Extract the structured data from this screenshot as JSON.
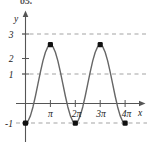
{
  "figure": {
    "problem_number": "65.",
    "axis_color": "#555555",
    "curve_color": "#666666",
    "grid_color": "#999999",
    "marker_color": "#111111",
    "background": "#ffffff"
  },
  "chart_data": {
    "type": "line",
    "title": "",
    "xlabel": "x",
    "ylabel": "y",
    "xlim": [
      -0.35,
      14.6
    ],
    "ylim": [
      -2.1,
      3.9
    ],
    "grid": true,
    "grid_lines_y": [
      3,
      1,
      -1
    ],
    "legend": null,
    "x_tick_labels": [
      "π",
      "2π",
      "3π",
      "4π"
    ],
    "x_tick_values": [
      3.14159,
      6.28319,
      9.42478,
      12.56637
    ],
    "y_tick_labels": [
      "3",
      "2",
      "1",
      "-1"
    ],
    "y_tick_values": [
      3,
      2,
      1,
      -1
    ],
    "series": [
      {
        "name": "y = 1 - 2cos(x)",
        "amplitude": 2,
        "midline": 1,
        "period": 6.28319,
        "x_start": 0,
        "x_end": 12.56637,
        "x": [
          0.0,
          0.3142,
          0.6283,
          0.9425,
          1.2566,
          1.5708,
          1.885,
          2.1991,
          2.5133,
          2.8274,
          3.1416,
          3.4558,
          3.7699,
          4.0841,
          4.3982,
          4.7124,
          5.0265,
          5.3407,
          5.6549,
          5.969,
          6.2832,
          6.5973,
          6.9115,
          7.2257,
          7.5398,
          7.854,
          8.1681,
          8.4823,
          8.7965,
          9.1106,
          9.4248,
          9.739,
          10.0531,
          10.3673,
          10.6814,
          10.9956,
          11.3097,
          11.6239,
          11.9381,
          12.2522,
          12.5664
        ],
        "y": [
          -1.0,
          -0.902,
          -0.618,
          -0.176,
          0.382,
          1.0,
          1.618,
          2.176,
          2.618,
          2.902,
          3.0,
          2.902,
          2.618,
          2.176,
          1.618,
          1.0,
          0.382,
          -0.176,
          -0.618,
          -0.902,
          -1.0,
          -0.902,
          -0.618,
          -0.176,
          0.382,
          1.0,
          1.618,
          2.176,
          2.618,
          2.902,
          3.0,
          2.902,
          2.618,
          2.176,
          1.618,
          1.0,
          0.382,
          -0.176,
          -0.618,
          -0.902,
          -1.0
        ]
      }
    ],
    "markers": [
      {
        "label": "start-minimum",
        "x": 0,
        "y": -1
      },
      {
        "label": "maximum-1",
        "x": 3.14159,
        "y": 3
      },
      {
        "label": "minimum-2",
        "x": 6.28319,
        "y": -1
      },
      {
        "label": "maximum-2",
        "x": 9.42478,
        "y": 3
      },
      {
        "label": "minimum-3",
        "x": 12.56637,
        "y": -1
      }
    ]
  }
}
